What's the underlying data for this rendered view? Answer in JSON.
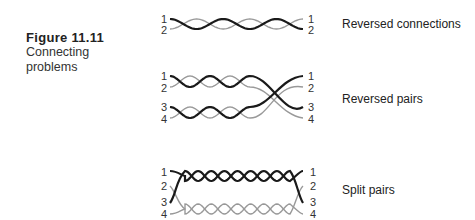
{
  "caption": {
    "figure_number": "Figure 11.11",
    "title": "Connecting problems"
  },
  "colors": {
    "dark_wire": "#1a1a1a",
    "light_wire": "#999999"
  },
  "diagrams": [
    {
      "label": "Reversed connections",
      "left_pins": [
        "1",
        "2"
      ],
      "right_pins": [
        "1",
        "2"
      ]
    },
    {
      "label": "Reversed pairs",
      "left_pins": [
        "1",
        "2",
        "3",
        "4"
      ],
      "right_pins": [
        "1",
        "2",
        "3",
        "4"
      ]
    },
    {
      "label": "Split pairs",
      "left_pins": [
        "1",
        "2",
        "3",
        "4"
      ],
      "right_pins": [
        "1",
        "2",
        "3",
        "4"
      ]
    }
  ]
}
